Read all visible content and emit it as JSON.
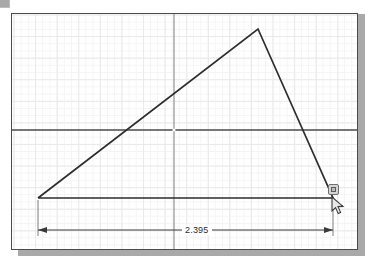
{
  "app": {
    "name": "sketch-canvas",
    "sheet_background": "#ffffff",
    "grid_major_color": "#e9e9ec",
    "grid_minor_color": "#f4f4f6",
    "axis_color": "#4b4b4b",
    "geometry_color": "#2d2d2d",
    "shadow_color": "#a9a9a9"
  },
  "canvas": {
    "origin_marker": "origin-dot",
    "horizontal_axis": "x-axis",
    "vertical_axis": "y-axis"
  },
  "sketch": {
    "shape": "triangle",
    "vertices": [
      {
        "name": "vertex-left",
        "x": 37,
        "y": 197
      },
      {
        "name": "vertex-apex",
        "x": 257,
        "y": 28
      },
      {
        "name": "vertex-right",
        "x": 332,
        "y": 197
      }
    ]
  },
  "dimension": {
    "name": "horizontal-distance",
    "value": "2.395",
    "units": "in",
    "arrow_style": "filled-arrowheads",
    "extension_from_x": 37,
    "extension_to_x": 332,
    "dimension_line_y": 229
  },
  "cursor": {
    "type": "arrow-pointer",
    "x": 334,
    "y": 200,
    "snap_badge": "coincident-constraint-icon"
  },
  "corner": {
    "chip": "ui-fragment"
  }
}
